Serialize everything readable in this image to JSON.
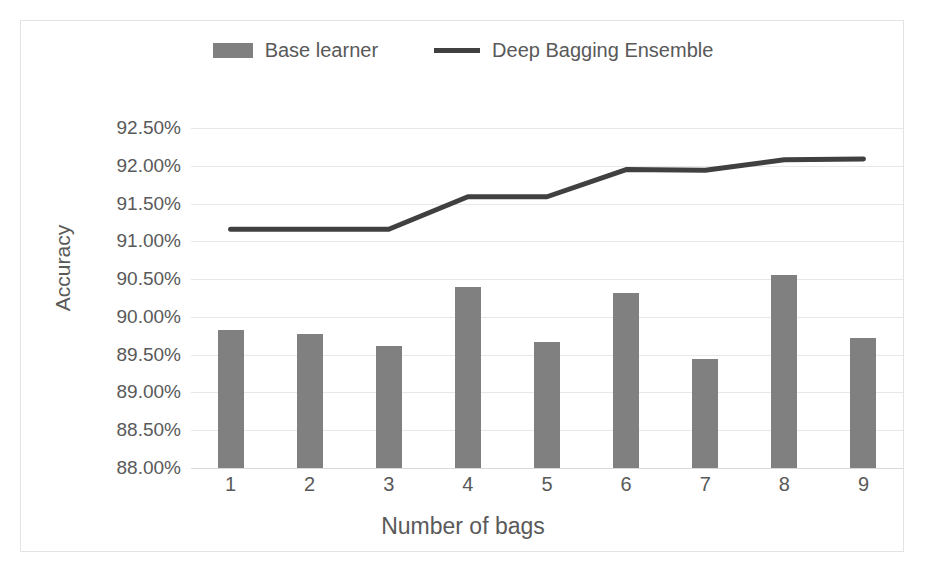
{
  "chart_data": {
    "type": "bar",
    "title": "",
    "xlabel": "Number of bags",
    "ylabel": "Accuracy",
    "categories": [
      "1",
      "2",
      "3",
      "4",
      "5",
      "6",
      "7",
      "8",
      "9"
    ],
    "ylim": [
      88.0,
      92.5
    ],
    "ytick_values": [
      88.0,
      88.5,
      89.0,
      89.5,
      90.0,
      90.5,
      91.0,
      91.5,
      92.0,
      92.5
    ],
    "ytick_labels": [
      "88.00%",
      "88.50%",
      "89.00%",
      "89.50%",
      "90.00%",
      "90.50%",
      "91.00%",
      "91.50%",
      "92.00%",
      "92.50%"
    ],
    "grid": true,
    "legend_position": "top-center",
    "series": [
      {
        "name": "Base learner",
        "type": "bar",
        "color": "#808080",
        "values": [
          89.82,
          89.78,
          89.61,
          90.4,
          89.67,
          90.31,
          89.44,
          90.55,
          89.72
        ]
      },
      {
        "name": "Deep Bagging Ensemble",
        "type": "line",
        "color": "#404040",
        "values": [
          91.16,
          91.16,
          91.16,
          91.59,
          91.59,
          91.95,
          91.94,
          92.08,
          92.09
        ]
      }
    ]
  },
  "legend": {
    "items": [
      {
        "label": "Base learner",
        "marker": "bar-swatch"
      },
      {
        "label": "Deep Bagging Ensemble",
        "marker": "line-swatch"
      }
    ]
  }
}
